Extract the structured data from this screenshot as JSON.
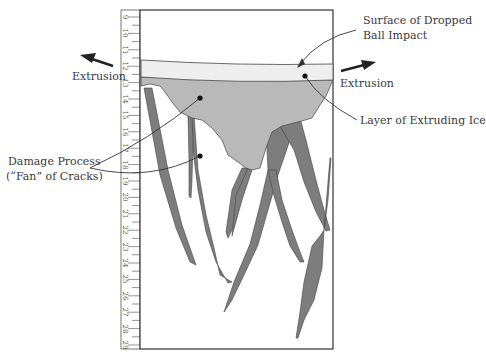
{
  "diagram": {
    "labels": {
      "surface": [
        "Surface of Dropped",
        "Ball Impact"
      ],
      "extrusion_left": "Extrusion",
      "extrusion_right": "Extrusion",
      "layer": "Layer of Extruding Ice",
      "damage": [
        "Damage Process",
        "(“Fan” of Cracks)"
      ]
    },
    "ruler": {
      "labels": [
        "9",
        "10",
        "11",
        "12",
        "13",
        "14",
        "15",
        "16",
        "17",
        "18",
        "19",
        "20",
        "21",
        "22",
        "23",
        "24",
        "25",
        "26",
        "27",
        "28",
        "29"
      ]
    },
    "colors": {
      "surface_band": "#eeeeee",
      "extruding_ice": "#b9b9b9",
      "cracks": "#7d7d7d",
      "outline": "#333333"
    },
    "icons": [
      "arrow-left-icon",
      "arrow-right-icon"
    ]
  }
}
